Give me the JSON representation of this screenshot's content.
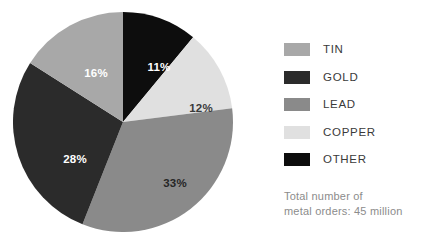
{
  "chart_data": {
    "type": "pie",
    "title": "",
    "subtitle": "",
    "xlabel": "",
    "ylabel": "",
    "grid": false,
    "legend_position": "right",
    "categories": [
      "TIN",
      "GOLD",
      "LEAD",
      "COPPER",
      "OTHER"
    ],
    "values": [
      16,
      28,
      33,
      12,
      11
    ],
    "value_unit": "%",
    "colors": [
      "#a8a8a8",
      "#2b2b2b",
      "#8a8a8a",
      "#e0e0e0",
      "#0d0d0d"
    ],
    "slices": [
      {
        "label": "OTHER",
        "value": 11,
        "display": "11%",
        "color": "#0d0d0d",
        "label_color": "#ffffff",
        "start_deg": 0,
        "end_deg": 39.6,
        "label_x": 146,
        "label_y": 56
      },
      {
        "label": "COPPER",
        "value": 12,
        "display": "12%",
        "color": "#e0e0e0",
        "label_color": "#3a3a3a",
        "start_deg": 39.6,
        "end_deg": 82.8,
        "label_x": 188,
        "label_y": 97
      },
      {
        "label": "LEAD",
        "value": 33,
        "display": "33%",
        "color": "#8a8a8a",
        "label_color": "#262626",
        "start_deg": 82.8,
        "end_deg": 201.6,
        "label_x": 162,
        "label_y": 172
      },
      {
        "label": "GOLD",
        "value": 28,
        "display": "28%",
        "color": "#2b2b2b",
        "label_color": "#ffffff",
        "start_deg": 201.6,
        "end_deg": 302.4,
        "label_x": 62,
        "label_y": 148
      },
      {
        "label": "TIN",
        "value": 16,
        "display": "16%",
        "color": "#a8a8a8",
        "label_color": "#ffffff",
        "start_deg": 302.4,
        "end_deg": 360,
        "label_x": 83,
        "label_y": 62
      }
    ],
    "annotations": [
      "Total number of",
      "metal orders: 45 million"
    ]
  },
  "legend": {
    "items": [
      {
        "label": "TIN",
        "color": "#a8a8a8"
      },
      {
        "label": "GOLD",
        "color": "#2b2b2b"
      },
      {
        "label": "LEAD",
        "color": "#8a8a8a"
      },
      {
        "label": "COPPER",
        "color": "#e0e0e0"
      },
      {
        "label": "OTHER",
        "color": "#0d0d0d"
      }
    ]
  },
  "total_note": {
    "line1": "Total number of",
    "line2": "metal orders: 45 million"
  }
}
